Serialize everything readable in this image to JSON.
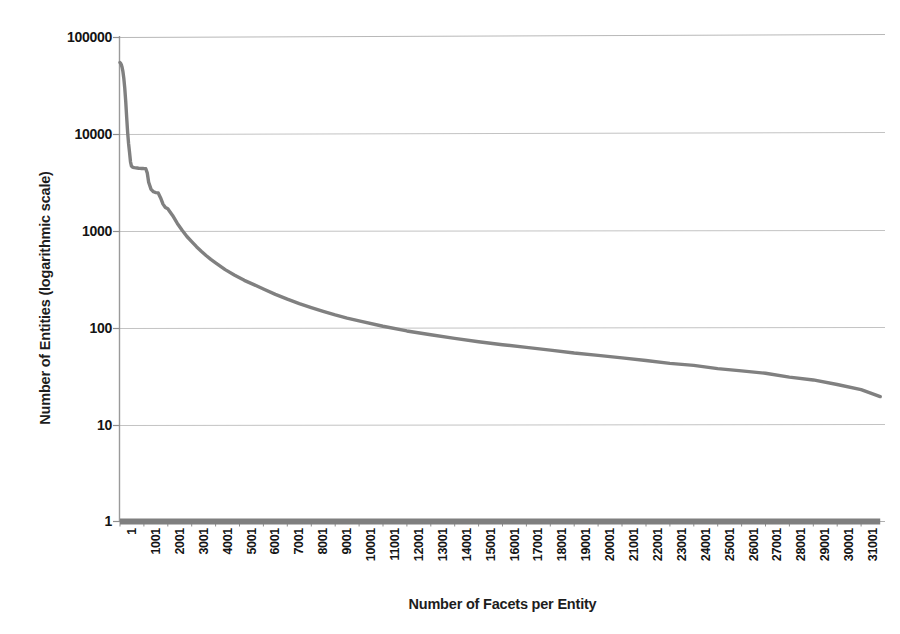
{
  "chart_data": {
    "type": "line",
    "title": "",
    "xlabel": "Number of Facets per Entity",
    "ylabel": "Number of Entities (logarithmic scale)",
    "yscale": "log",
    "ylim": [
      1,
      100000
    ],
    "xlim": [
      1,
      32000
    ],
    "grid": true,
    "legend": "none",
    "ytick_labels": [
      "100000",
      "10000",
      "1000",
      "100",
      "10",
      "1"
    ],
    "ytick_values": [
      100000,
      10000,
      1000,
      100,
      10,
      1
    ],
    "xtick_labels": [
      "1",
      "1001",
      "2001",
      "3001",
      "4001",
      "5001",
      "6001",
      "7001",
      "8001",
      "9001",
      "10001",
      "11001",
      "12001",
      "13001",
      "14001",
      "15001",
      "16001",
      "17001",
      "18001",
      "19001",
      "20001",
      "21001",
      "22001",
      "23001",
      "24001",
      "25001",
      "26001",
      "27001",
      "28001",
      "29001",
      "30001",
      "31001"
    ],
    "xtick_values": [
      1,
      1001,
      2001,
      3001,
      4001,
      5001,
      6001,
      7001,
      8001,
      9001,
      10001,
      11001,
      12001,
      13001,
      14001,
      15001,
      16001,
      17001,
      18001,
      19001,
      20001,
      21001,
      22001,
      23001,
      24001,
      25001,
      26001,
      27001,
      28001,
      29001,
      30001,
      31001
    ],
    "series": [
      {
        "name": "Number of Entities",
        "color": "#808080",
        "x": [
          1,
          30,
          60,
          90,
          120,
          160,
          200,
          240,
          280,
          320,
          360,
          400,
          440,
          480,
          520,
          560,
          600,
          660,
          720,
          780,
          840,
          900,
          960,
          1020,
          1080,
          1140,
          1200,
          1300,
          1400,
          1500,
          1600,
          1700,
          1800,
          1900,
          2000,
          2200,
          2400,
          2600,
          2800,
          3000,
          3200,
          3400,
          3600,
          3800,
          4000,
          4400,
          4800,
          5200,
          5600,
          6000,
          6500,
          7000,
          7500,
          8000,
          8500,
          9000,
          9500,
          10000,
          11000,
          12000,
          13000,
          14000,
          15000,
          16000,
          17000,
          18000,
          19000,
          20000,
          21000,
          22000,
          23000,
          24000,
          25000,
          26000,
          27000,
          28000,
          29000,
          30000,
          31000,
          31800
        ],
        "y": [
          55000,
          54000,
          52000,
          49000,
          45000,
          38000,
          30000,
          22000,
          15000,
          10500,
          8000,
          6500,
          5200,
          4700,
          4600,
          4550,
          4520,
          4500,
          4480,
          4460,
          4450,
          4440,
          4430,
          4420,
          4400,
          4000,
          3200,
          2700,
          2550,
          2500,
          2480,
          2200,
          1900,
          1750,
          1700,
          1450,
          1200,
          1020,
          880,
          780,
          690,
          620,
          560,
          510,
          470,
          400,
          350,
          310,
          280,
          252,
          222,
          198,
          178,
          162,
          148,
          136,
          126,
          118,
          104,
          93,
          85,
          78,
          72,
          67,
          63,
          59,
          55,
          52,
          49,
          46,
          43,
          41,
          38,
          36,
          34,
          31,
          29,
          26,
          23,
          19.5
        ]
      },
      {
        "name": "Baseline",
        "color": "#7f7f7f",
        "constant_y": 1,
        "x": [
          1,
          31800
        ],
        "y": [
          1,
          1
        ]
      }
    ]
  }
}
